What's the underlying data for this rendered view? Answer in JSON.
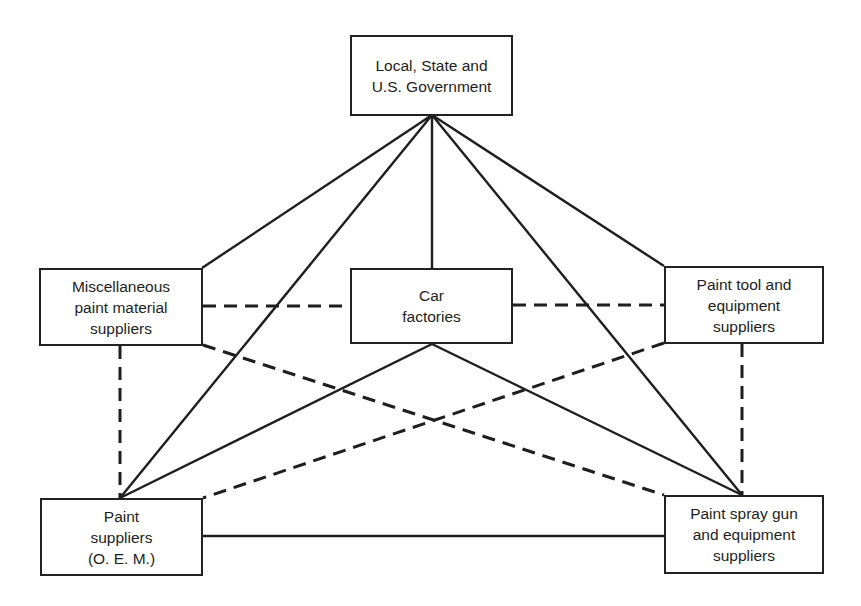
{
  "nodes": {
    "government": {
      "label": "Local, State and\nU.S. Government",
      "x": 350,
      "y": 35,
      "w": 163,
      "h": 81
    },
    "misc_suppliers": {
      "label": "Miscellaneous\npaint material\nsuppliers",
      "x": 39,
      "y": 268,
      "w": 164,
      "h": 78
    },
    "car_factories": {
      "label": "Car\nfactories",
      "x": 350,
      "y": 268,
      "w": 163,
      "h": 76
    },
    "tool_suppliers": {
      "label": "Paint tool and\nequipment\nsuppliers",
      "x": 664,
      "y": 266,
      "w": 160,
      "h": 78
    },
    "paint_suppliers": {
      "label": "Paint\nsuppliers\n(O. E. M.)",
      "x": 40,
      "y": 498,
      "w": 163,
      "h": 78
    },
    "spray_gun_suppliers": {
      "label": "Paint spray gun\nand equipment\nsuppliers",
      "x": 664,
      "y": 495,
      "w": 160,
      "h": 79
    }
  },
  "edges": [
    {
      "from": "government",
      "to": "misc_suppliers",
      "style": "solid",
      "x1": 432,
      "y1": 115,
      "x2": 202,
      "y2": 268
    },
    {
      "from": "government",
      "to": "car_factories",
      "style": "solid",
      "x1": 432,
      "y1": 115,
      "x2": 432,
      "y2": 268
    },
    {
      "from": "government",
      "to": "tool_suppliers",
      "style": "solid",
      "x1": 432,
      "y1": 115,
      "x2": 664,
      "y2": 266
    },
    {
      "from": "government",
      "to": "paint_suppliers",
      "style": "solid",
      "x1": 432,
      "y1": 115,
      "x2": 120,
      "y2": 498
    },
    {
      "from": "government",
      "to": "spray_gun_suppliers",
      "style": "solid",
      "x1": 432,
      "y1": 115,
      "x2": 742,
      "y2": 495
    },
    {
      "from": "car_factories",
      "to": "paint_suppliers",
      "style": "solid",
      "x1": 432,
      "y1": 344,
      "x2": 120,
      "y2": 498
    },
    {
      "from": "car_factories",
      "to": "spray_gun_suppliers",
      "style": "solid",
      "x1": 432,
      "y1": 344,
      "x2": 742,
      "y2": 495
    },
    {
      "from": "paint_suppliers",
      "to": "spray_gun_suppliers",
      "style": "solid",
      "x1": 203,
      "y1": 536,
      "x2": 664,
      "y2": 536
    },
    {
      "from": "misc_suppliers",
      "to": "car_factories",
      "style": "dashed",
      "x1": 203,
      "y1": 306,
      "x2": 350,
      "y2": 306
    },
    {
      "from": "car_factories",
      "to": "tool_suppliers",
      "style": "dashed",
      "x1": 513,
      "y1": 305,
      "x2": 664,
      "y2": 305
    },
    {
      "from": "misc_suppliers",
      "to": "paint_suppliers",
      "style": "dashed",
      "x1": 120,
      "y1": 346,
      "x2": 120,
      "y2": 498
    },
    {
      "from": "tool_suppliers",
      "to": "spray_gun_suppliers",
      "style": "dashed",
      "x1": 742,
      "y1": 344,
      "x2": 742,
      "y2": 495
    },
    {
      "from": "misc_suppliers",
      "to": "spray_gun_suppliers",
      "style": "dashed",
      "x1": 203,
      "y1": 345,
      "x2": 664,
      "y2": 495
    },
    {
      "from": "tool_suppliers",
      "to": "paint_suppliers",
      "style": "dashed",
      "x1": 664,
      "y1": 343,
      "x2": 203,
      "y2": 498
    }
  ],
  "colors": {
    "line": "#1e1e1e",
    "box_border": "#222222",
    "background": "#ffffff"
  }
}
